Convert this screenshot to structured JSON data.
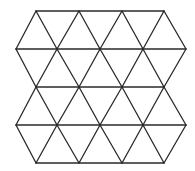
{
  "figure": {
    "stroke_color": "#2a2a2a",
    "background": "#ffffff",
    "rows": [
      {
        "y": 11,
        "xs": [
          36,
          79,
          122,
          164
        ]
      },
      {
        "y": 49,
        "xs": [
          16,
          57,
          100,
          143,
          186
        ]
      },
      {
        "y": 87,
        "xs": [
          36,
          79,
          122,
          164
        ]
      },
      {
        "y": 125,
        "xs": [
          16,
          57,
          100,
          143,
          186
        ]
      },
      {
        "y": 163,
        "xs": [
          36,
          79,
          122,
          164
        ]
      }
    ]
  }
}
